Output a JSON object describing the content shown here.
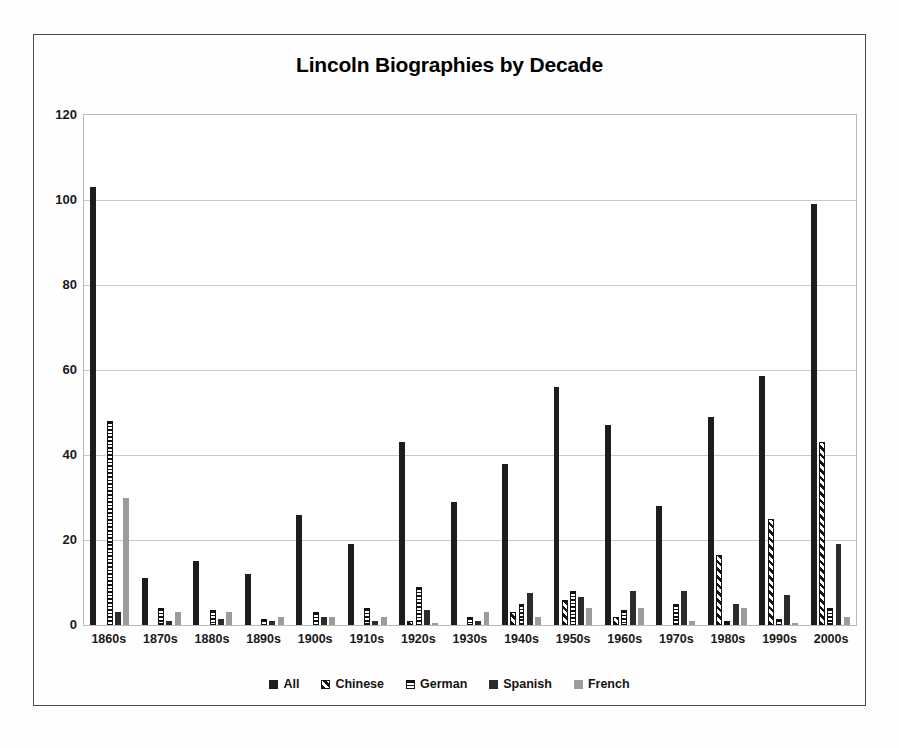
{
  "chart_data": {
    "type": "bar",
    "title": "Lincoln Biographies by Decade",
    "xlabel": "",
    "ylabel": "",
    "ylim": [
      0,
      120
    ],
    "yticks": [
      0,
      20,
      40,
      60,
      80,
      100,
      120
    ],
    "grid": true,
    "legend_position": "bottom",
    "categories": [
      "1860s",
      "1870s",
      "1880s",
      "1890s",
      "1900s",
      "1910s",
      "1920s",
      "1930s",
      "1940s",
      "1950s",
      "1960s",
      "1970s",
      "1980s",
      "1990s",
      "2000s"
    ],
    "series": [
      {
        "name": "All",
        "pattern": "solid-black",
        "color": "#1d1d1d",
        "values": [
          103,
          11,
          15,
          12,
          26,
          19,
          43,
          29,
          38,
          56,
          47,
          28,
          49,
          58.5,
          99
        ]
      },
      {
        "name": "Chinese",
        "pattern": "diagonal-stripes",
        "color": "#141414",
        "values": [
          0,
          0,
          0,
          0,
          0,
          0,
          1,
          0,
          3,
          6,
          2,
          0,
          16.5,
          25,
          43
        ]
      },
      {
        "name": "German",
        "pattern": "horizontal-stripes",
        "color": "#141414",
        "values": [
          48,
          4,
          3.5,
          1.5,
          3,
          4,
          9,
          2,
          5,
          8,
          3.5,
          5,
          1,
          1.5,
          4
        ]
      },
      {
        "name": "Spanish",
        "pattern": "solid-black",
        "color": "#2b2b2b",
        "values": [
          3,
          1,
          1.5,
          1,
          2,
          1,
          3.5,
          1,
          7.5,
          6.5,
          8,
          8,
          5,
          7,
          19
        ]
      },
      {
        "name": "French",
        "pattern": "solid-gray",
        "color": "#9c9c9c",
        "values": [
          30,
          3,
          3,
          2,
          2,
          2,
          0.5,
          3,
          2,
          4,
          4,
          1,
          4,
          0.5,
          2
        ]
      }
    ]
  },
  "legend": {
    "items": [
      {
        "label": "All",
        "swatch": "legend-swatch-all"
      },
      {
        "label": "Chinese",
        "swatch": "legend-swatch-chinese"
      },
      {
        "label": "German",
        "swatch": "legend-swatch-german"
      },
      {
        "label": "Spanish",
        "swatch": "legend-swatch-spanish"
      },
      {
        "label": "French",
        "swatch": "legend-swatch-french"
      }
    ]
  }
}
